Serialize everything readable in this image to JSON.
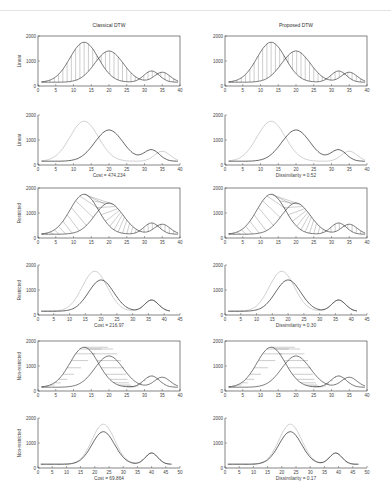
{
  "figure": {
    "columns": [
      {
        "title": "Classical DTW",
        "left": 38
      },
      {
        "title": "Proposed DTW",
        "left": 225
      }
    ]
  },
  "chart_data": [
    {
      "panel": "r1c1",
      "type": "line",
      "title": "Classical DTW",
      "ylabel": "Linear",
      "xlim": [
        0,
        40
      ],
      "ylim": [
        0,
        2000
      ],
      "xticks": [
        0,
        5,
        10,
        15,
        20,
        25,
        30,
        35,
        40
      ],
      "yticks": [
        0,
        1000,
        2000
      ],
      "annotation": "vertical warping lines",
      "series": [
        {
          "name": "query",
          "peaks": [
            [
              13,
              1750
            ],
            [
              32,
              600
            ]
          ]
        },
        {
          "name": "reference",
          "peaks": [
            [
              20,
              1400
            ],
            [
              35,
              550
            ]
          ]
        }
      ]
    },
    {
      "panel": "r2c1",
      "type": "line",
      "ylabel": "Linear",
      "xlim": [
        0,
        40
      ],
      "ylim": [
        0,
        2000
      ],
      "xticks": [
        0,
        5,
        10,
        15,
        20,
        25,
        30,
        35,
        40
      ],
      "yticks": [
        0,
        1000,
        2000
      ],
      "caption": "Cost = 474.234",
      "series": [
        {
          "name": "aligned (gray)",
          "peaks": [
            [
              13,
              1750
            ],
            [
              35,
              550
            ]
          ]
        },
        {
          "name": "reference",
          "peaks": [
            [
              20,
              1400
            ],
            [
              32,
              600
            ]
          ]
        }
      ]
    },
    {
      "panel": "r3c1",
      "type": "line",
      "ylabel": "Restricted",
      "xlim": [
        0,
        40
      ],
      "ylim": [
        0,
        2000
      ],
      "xticks": [
        0,
        5,
        10,
        15,
        20,
        25,
        30,
        35,
        40
      ],
      "yticks": [
        0,
        1000,
        2000
      ],
      "annotation": "slanted warping lines",
      "series": [
        {
          "name": "query",
          "peaks": [
            [
              13,
              1750
            ],
            [
              32,
              600
            ]
          ]
        },
        {
          "name": "reference",
          "peaks": [
            [
              20,
              1400
            ],
            [
              35,
              550
            ]
          ]
        }
      ]
    },
    {
      "panel": "r4c1",
      "type": "line",
      "ylabel": "Restricted",
      "xlim": [
        0,
        45
      ],
      "ylim": [
        0,
        2000
      ],
      "xticks": [
        0,
        5,
        10,
        15,
        20,
        25,
        30,
        35,
        40,
        45
      ],
      "yticks": [
        0,
        1000,
        2000
      ],
      "caption": "Cost = 216.97",
      "series": [
        {
          "name": "aligned (gray)",
          "peaks": [
            [
              18,
              1750
            ],
            [
              36,
              600
            ]
          ]
        },
        {
          "name": "reference",
          "peaks": [
            [
              20,
              1400
            ],
            [
              36,
              600
            ]
          ]
        }
      ]
    },
    {
      "panel": "r5c1",
      "type": "line",
      "ylabel": "Non-restricted",
      "xlim": [
        0,
        40
      ],
      "ylim": [
        0,
        2000
      ],
      "xticks": [
        0,
        5,
        10,
        15,
        20,
        25,
        30,
        35,
        40
      ],
      "yticks": [
        0,
        1000,
        2000
      ],
      "annotation": "horizontal warping lines",
      "series": [
        {
          "name": "query",
          "peaks": [
            [
              13,
              1750
            ],
            [
              32,
              600
            ]
          ]
        },
        {
          "name": "reference",
          "peaks": [
            [
              20,
              1400
            ],
            [
              35,
              550
            ]
          ]
        }
      ]
    },
    {
      "panel": "r6c1",
      "type": "line",
      "ylabel": "Non-restricted",
      "xlim": [
        0,
        50
      ],
      "ylim": [
        0,
        2000
      ],
      "xticks": [
        0,
        5,
        10,
        15,
        20,
        25,
        30,
        35,
        40,
        45,
        50
      ],
      "yticks": [
        0,
        1000,
        2000
      ],
      "caption": "Cost = 69.864",
      "series": [
        {
          "name": "aligned (gray)",
          "peaks": [
            [
              23,
              1750
            ],
            [
              40,
              600
            ]
          ]
        },
        {
          "name": "reference",
          "peaks": [
            [
              23,
              1450
            ],
            [
              40,
              600
            ]
          ]
        }
      ]
    },
    {
      "panel": "r1c2",
      "type": "line",
      "title": "Proposed DTW",
      "xlim": [
        0,
        40
      ],
      "ylim": [
        0,
        2000
      ],
      "xticks": [
        0,
        5,
        10,
        15,
        20,
        25,
        30,
        35,
        40
      ],
      "yticks": [
        0,
        1000,
        2000
      ],
      "annotation": "vertical warping lines",
      "series": [
        {
          "name": "query",
          "peaks": [
            [
              13,
              1750
            ],
            [
              32,
              600
            ]
          ]
        },
        {
          "name": "reference",
          "peaks": [
            [
              20,
              1400
            ],
            [
              35,
              550
            ]
          ]
        }
      ]
    },
    {
      "panel": "r2c2",
      "type": "line",
      "xlim": [
        0,
        40
      ],
      "ylim": [
        0,
        2000
      ],
      "xticks": [
        0,
        5,
        10,
        15,
        20,
        25,
        30,
        35,
        40
      ],
      "yticks": [
        0,
        1000,
        2000
      ],
      "caption": "Dissimilarity = 0.52",
      "series": [
        {
          "name": "aligned (gray)",
          "peaks": [
            [
              13,
              1750
            ],
            [
              35,
              550
            ]
          ]
        },
        {
          "name": "reference",
          "peaks": [
            [
              20,
              1400
            ],
            [
              32,
              600
            ]
          ]
        }
      ]
    },
    {
      "panel": "r3c2",
      "type": "line",
      "xlim": [
        0,
        40
      ],
      "ylim": [
        0,
        2000
      ],
      "xticks": [
        0,
        5,
        10,
        15,
        20,
        25,
        30,
        35,
        40
      ],
      "yticks": [
        0,
        1000,
        2000
      ],
      "annotation": "slanted warping lines",
      "series": [
        {
          "name": "query",
          "peaks": [
            [
              13,
              1750
            ],
            [
              32,
              600
            ]
          ]
        },
        {
          "name": "reference",
          "peaks": [
            [
              20,
              1400
            ],
            [
              35,
              550
            ]
          ]
        }
      ]
    },
    {
      "panel": "r4c2",
      "type": "line",
      "xlim": [
        0,
        45
      ],
      "ylim": [
        0,
        2000
      ],
      "xticks": [
        0,
        5,
        10,
        15,
        20,
        25,
        30,
        35,
        40,
        45
      ],
      "yticks": [
        0,
        1000,
        2000
      ],
      "caption": "Dissimilarity = 0.30",
      "series": [
        {
          "name": "aligned (gray)",
          "peaks": [
            [
              18,
              1750
            ],
            [
              36,
              600
            ]
          ]
        },
        {
          "name": "reference",
          "peaks": [
            [
              20,
              1400
            ],
            [
              36,
              600
            ]
          ]
        }
      ]
    },
    {
      "panel": "r5c2",
      "type": "line",
      "xlim": [
        0,
        40
      ],
      "ylim": [
        0,
        2000
      ],
      "xticks": [
        0,
        5,
        10,
        15,
        20,
        25,
        30,
        35,
        40
      ],
      "yticks": [
        0,
        1000,
        2000
      ],
      "annotation": "horizontal warping lines",
      "series": [
        {
          "name": "query",
          "peaks": [
            [
              13,
              1750
            ],
            [
              32,
              600
            ]
          ]
        },
        {
          "name": "reference",
          "peaks": [
            [
              20,
              1400
            ],
            [
              35,
              550
            ]
          ]
        }
      ]
    },
    {
      "panel": "r6c2",
      "type": "line",
      "xlim": [
        0,
        50
      ],
      "ylim": [
        0,
        2000
      ],
      "xticks": [
        0,
        5,
        10,
        15,
        20,
        25,
        30,
        35,
        40,
        45,
        50
      ],
      "yticks": [
        0,
        1000,
        2000
      ],
      "caption": "Dissimilarity = 0.17",
      "series": [
        {
          "name": "aligned (gray)",
          "peaks": [
            [
              23,
              1750
            ],
            [
              39,
              600
            ]
          ]
        },
        {
          "name": "reference",
          "peaks": [
            [
              23,
              1450
            ],
            [
              39,
              600
            ]
          ]
        }
      ]
    }
  ]
}
